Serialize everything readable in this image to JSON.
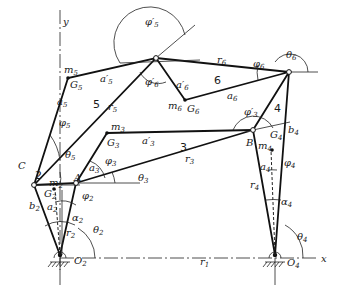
{
  "diagram": {
    "axes": {
      "x_label": "x",
      "y_label": "y"
    },
    "ground_pivots": [
      {
        "id": "O2",
        "label": "O",
        "sub": "2"
      },
      {
        "id": "O4",
        "label": "O",
        "sub": "4"
      }
    ],
    "joints": [
      {
        "id": "A",
        "label": "A"
      },
      {
        "id": "B",
        "label": "B"
      },
      {
        "id": "C",
        "label": "C"
      }
    ],
    "link_numbers": [
      "2",
      "3",
      "4",
      "5",
      "6"
    ],
    "mass_centers": [
      {
        "G": "G",
        "G_sub": "2",
        "m": "m",
        "m_sub": "2"
      },
      {
        "G": "G",
        "G_sub": "3",
        "m": "m",
        "m_sub": "3"
      },
      {
        "G": "G",
        "G_sub": "4",
        "m": "m",
        "m_sub": "4"
      },
      {
        "G": "G",
        "G_sub": "5",
        "m": "m",
        "m_sub": "5"
      },
      {
        "G": "G",
        "G_sub": "6",
        "m": "m",
        "m_sub": "6"
      }
    ],
    "lengths": {
      "r1": {
        "t": "r",
        "s": "1"
      },
      "r2": {
        "t": "r",
        "s": "2"
      },
      "r3": {
        "t": "r",
        "s": "3"
      },
      "r4": {
        "t": "r",
        "s": "4"
      },
      "r5": {
        "t": "r",
        "s": "5"
      },
      "r6": {
        "t": "r",
        "s": "6"
      },
      "a2": {
        "t": "a",
        "s": "2"
      },
      "a3": {
        "t": "a",
        "s": "3"
      },
      "a3p": {
        "t": "a′",
        "s": "3"
      },
      "a4": {
        "t": "a",
        "s": "4"
      },
      "a5": {
        "t": "a",
        "s": "5"
      },
      "a5p": {
        "t": "a′",
        "s": "5"
      },
      "a6": {
        "t": "a",
        "s": "6"
      },
      "a6p": {
        "t": "a′",
        "s": "6"
      },
      "b2": {
        "t": "b",
        "s": "2"
      },
      "b4": {
        "t": "b",
        "s": "4"
      }
    },
    "angles": {
      "theta2": {
        "t": "θ",
        "s": "2"
      },
      "theta3": {
        "t": "θ",
        "s": "3"
      },
      "theta4": {
        "t": "θ",
        "s": "4"
      },
      "theta5": {
        "t": "θ",
        "s": "5"
      },
      "theta6": {
        "t": "θ",
        "s": "6"
      },
      "phi2": {
        "t": "φ",
        "s": "2"
      },
      "phi3": {
        "t": "φ",
        "s": "3"
      },
      "phi3p": {
        "t": "φ′",
        "s": "3"
      },
      "phi4": {
        "t": "φ",
        "s": "4"
      },
      "phi5": {
        "t": "φ",
        "s": "5"
      },
      "phi5p": {
        "t": "φ′",
        "s": "5"
      },
      "phi6": {
        "t": "φ",
        "s": "6"
      },
      "phi6p": {
        "t": "φ′",
        "s": "6"
      },
      "alpha2": {
        "t": "α",
        "s": "2"
      },
      "alpha4": {
        "t": "α",
        "s": "4"
      }
    }
  }
}
